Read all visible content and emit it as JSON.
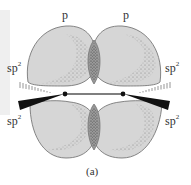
{
  "diagram": {
    "labels": {
      "p_left": "p",
      "p_right": "p",
      "sp2_top_left": "sp",
      "sp2_top_right": "sp",
      "sp2_bottom_left": "sp",
      "sp2_bottom_right": "sp",
      "superscript": "2"
    },
    "caption": "(a)",
    "colors": {
      "lobe_fill": "#d6d6d6",
      "overlap_fill": "#9a9a9a",
      "outline": "#6a6a6a",
      "bond": "#555555",
      "atom": "#111111"
    }
  }
}
